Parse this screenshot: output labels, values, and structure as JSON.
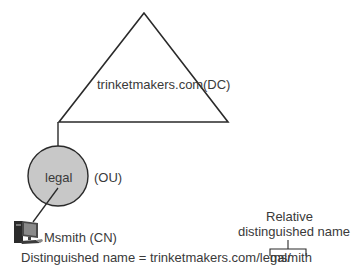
{
  "domain_label": {
    "name": "trinketmakers.com",
    "type": "(DC)"
  },
  "ou": {
    "name": "legal",
    "type": "(OU)",
    "fill": "#c8c8c8"
  },
  "cn": {
    "name": "Msmith (CN)"
  },
  "annotation": {
    "line1": "Relative",
    "line2": "distinguished name"
  },
  "distinguished_name": {
    "prefix": "Distinguished name = trinketmakers.com/legal/",
    "rdn": "msmith"
  }
}
